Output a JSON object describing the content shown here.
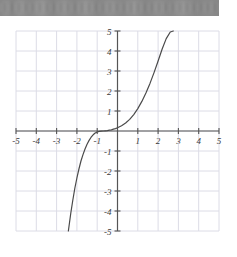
{
  "topbar": {
    "name": "obscured-header-bar",
    "text": "",
    "color": "#878787"
  },
  "chart_data": {
    "type": "line",
    "title": "",
    "xlabel": "",
    "ylabel": "",
    "xlim": [
      -5,
      5
    ],
    "ylim": [
      -5,
      5
    ],
    "grid": true,
    "legend": null,
    "x_ticks": [
      -5,
      -4,
      -3,
      -2,
      -1,
      1,
      2,
      3,
      4,
      5
    ],
    "y_ticks": [
      5,
      4,
      3,
      2,
      1,
      -1,
      -2,
      -3,
      -4,
      -5
    ],
    "x_tick_labels": [
      "-5",
      "-4",
      "-3",
      "-2",
      "-1",
      "1",
      "2",
      "3",
      "4",
      "5"
    ],
    "y_tick_labels": [
      "5",
      "4",
      "3",
      "2",
      "1",
      "-1",
      "-2",
      "-3",
      "-4",
      "-5"
    ],
    "series": [
      {
        "name": "cubic-curve",
        "color": "#4a4a4a",
        "points": [
          [
            -2.42,
            -5.0
          ],
          [
            -2.3,
            -4.1
          ],
          [
            -2.2,
            -3.45
          ],
          [
            -2.1,
            -2.85
          ],
          [
            -2.0,
            -2.35
          ],
          [
            -1.9,
            -1.9
          ],
          [
            -1.8,
            -1.5
          ],
          [
            -1.7,
            -1.18
          ],
          [
            -1.6,
            -0.9
          ],
          [
            -1.5,
            -0.66
          ],
          [
            -1.4,
            -0.47
          ],
          [
            -1.3,
            -0.31
          ],
          [
            -1.2,
            -0.19
          ],
          [
            -1.1,
            -0.1
          ],
          [
            -1.0,
            -0.05
          ],
          [
            -0.9,
            -0.02
          ],
          [
            -0.8,
            -0.01
          ],
          [
            -0.7,
            0.0
          ],
          [
            -0.6,
            0.01
          ],
          [
            -0.5,
            0.02
          ],
          [
            -0.4,
            0.04
          ],
          [
            -0.3,
            0.06
          ],
          [
            -0.2,
            0.09
          ],
          [
            -0.1,
            0.12
          ],
          [
            0.0,
            0.16
          ],
          [
            0.2,
            0.26
          ],
          [
            0.4,
            0.4
          ],
          [
            0.6,
            0.58
          ],
          [
            0.8,
            0.82
          ],
          [
            1.0,
            1.12
          ],
          [
            1.2,
            1.48
          ],
          [
            1.4,
            1.9
          ],
          [
            1.6,
            2.38
          ],
          [
            1.8,
            2.92
          ],
          [
            2.0,
            3.5
          ],
          [
            2.2,
            4.1
          ],
          [
            2.4,
            4.62
          ],
          [
            2.6,
            4.95
          ],
          [
            2.75,
            5.0
          ]
        ]
      }
    ],
    "colors": {
      "grid": "#dcdce6",
      "axis": "#555555",
      "curve": "#4a4a4a",
      "background": "#ffffff"
    }
  }
}
